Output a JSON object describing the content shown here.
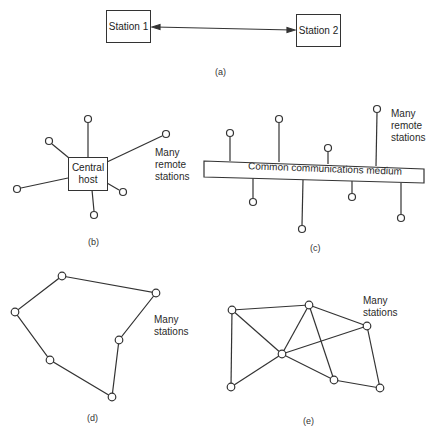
{
  "panels": {
    "a": {
      "caption": "(a)",
      "station1": "Station 1",
      "station2": "Station 2"
    },
    "b": {
      "caption": "(b)",
      "host_line1": "Central",
      "host_line2": "host",
      "label_line1": "Many",
      "label_line2": "remote",
      "label_line3": "stations"
    },
    "c": {
      "caption": "(c)",
      "medium": "Common communications medium",
      "label_line1": "Many",
      "label_line2": "remote",
      "label_line3": "stations"
    },
    "d": {
      "caption": "(d)",
      "label_line1": "Many",
      "label_line2": "stations"
    },
    "e": {
      "caption": "(e)",
      "label_line1": "Many",
      "label_line2": "stations"
    }
  }
}
